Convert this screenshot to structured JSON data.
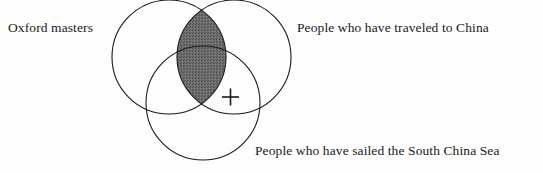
{
  "figure": {
    "type": "venn-diagram",
    "set_count": 3,
    "background_color": "#fdfdfd",
    "stroke_color": "#1a1a1a",
    "shaded_fill_color": "#6a6a6a",
    "text_color": "#1a1a1a"
  },
  "labels": {
    "left": "Oxford masters",
    "right": "People who have traveled to China",
    "bottom": "People who have sailed the South China Sea"
  },
  "markers": {
    "plus": "+"
  },
  "circles": {
    "left": {
      "cx": 169,
      "cy": 57,
      "r": 57
    },
    "right": {
      "cx": 234,
      "cy": 57,
      "r": 57
    },
    "bottom": {
      "cx": 203,
      "cy": 103,
      "r": 57
    }
  },
  "shaded_region": {
    "description": "intersection of left and right circles",
    "sets": [
      "left",
      "right"
    ]
  }
}
